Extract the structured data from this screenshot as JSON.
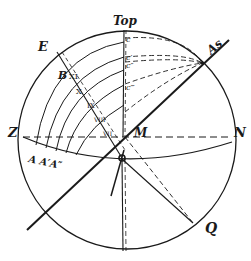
{
  "diagram": {
    "type": "celestial sphere construction (sundial geometry)",
    "colors": {
      "ink": "#1a1a1a",
      "paper": "#ffffff"
    },
    "labels": {
      "top": "Top",
      "east": "E",
      "as": "As",
      "z": "Z",
      "n": "N",
      "m": "M",
      "q": "Q",
      "b": "B",
      "a_group": "A A′A″",
      "c": "c",
      "c1": "c′",
      "c2": "c″",
      "c3": "c‴"
    },
    "hour_marks": [
      "XI",
      "X",
      "IX",
      "VIII",
      "VII"
    ]
  }
}
